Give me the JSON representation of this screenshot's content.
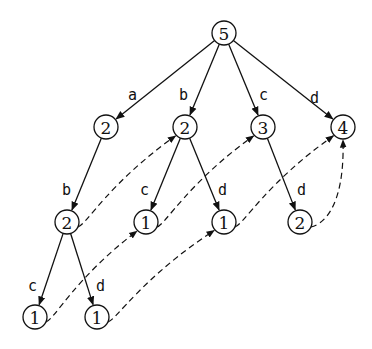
{
  "diagram": {
    "type": "tree with suffix links",
    "nodes": [
      {
        "id": "root",
        "label": "5",
        "x": 224,
        "y": 33
      },
      {
        "id": "a",
        "label": "2",
        "x": 106,
        "y": 127
      },
      {
        "id": "b",
        "label": "2",
        "x": 185,
        "y": 127
      },
      {
        "id": "c",
        "label": "3",
        "x": 263,
        "y": 127
      },
      {
        "id": "d",
        "label": "4",
        "x": 343,
        "y": 127
      },
      {
        "id": "ab",
        "label": "2",
        "x": 67,
        "y": 222
      },
      {
        "id": "bc",
        "label": "1",
        "x": 146,
        "y": 222
      },
      {
        "id": "bd",
        "label": "1",
        "x": 224,
        "y": 222
      },
      {
        "id": "cd",
        "label": "2",
        "x": 300,
        "y": 222
      },
      {
        "id": "abc",
        "label": "1",
        "x": 35,
        "y": 317
      },
      {
        "id": "abd",
        "label": "1",
        "x": 97,
        "y": 317
      }
    ],
    "edges": [
      {
        "from": "root",
        "to": "a",
        "label": "a",
        "lx": 128,
        "ly": 100
      },
      {
        "from": "root",
        "to": "b",
        "label": "b",
        "lx": 179,
        "ly": 100
      },
      {
        "from": "root",
        "to": "c",
        "label": "c",
        "lx": 259,
        "ly": 100
      },
      {
        "from": "root",
        "to": "d",
        "label": "d",
        "lx": 310,
        "ly": 103
      },
      {
        "from": "a",
        "to": "ab",
        "label": "b",
        "lx": 62,
        "ly": 195
      },
      {
        "from": "b",
        "to": "bc",
        "label": "c",
        "lx": 140,
        "ly": 195
      },
      {
        "from": "b",
        "to": "bd",
        "label": "d",
        "lx": 218,
        "ly": 195
      },
      {
        "from": "c",
        "to": "cd",
        "label": "d",
        "lx": 297,
        "ly": 195
      },
      {
        "from": "ab",
        "to": "abc",
        "label": "c",
        "lx": 28,
        "ly": 291
      },
      {
        "from": "ab",
        "to": "abd",
        "label": "d",
        "lx": 96,
        "ly": 291
      }
    ],
    "links": [
      {
        "from": "ab",
        "to": "b"
      },
      {
        "from": "bc",
        "to": "c"
      },
      {
        "from": "bd",
        "to": "d"
      },
      {
        "from": "cd",
        "to": "d"
      },
      {
        "from": "abc",
        "to": "bc"
      },
      {
        "from": "abd",
        "to": "bd"
      }
    ]
  }
}
